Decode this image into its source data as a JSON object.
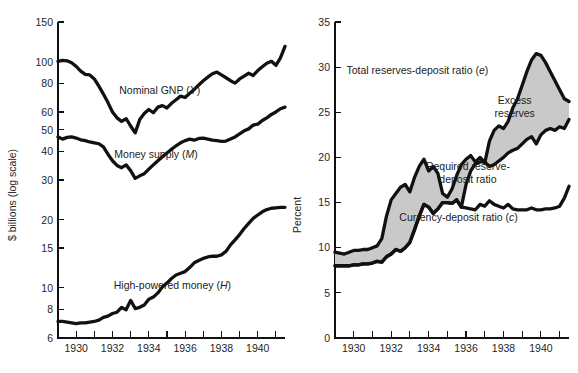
{
  "figure": {
    "background": "#ffffff",
    "line_color": "#111111",
    "band_color": "#c9c9c9",
    "axis_color": "#111111"
  },
  "chart_data": [
    {
      "id": "left",
      "type": "line",
      "title": "",
      "xlabel": "",
      "ylabel": "$ billions (log scale)",
      "yscale": "log",
      "ylim": [
        6,
        150
      ],
      "xlim": [
        1929.0,
        1941.5
      ],
      "grid": false,
      "legend": "inline-annotations",
      "yticks": [
        6,
        8,
        10,
        15,
        20,
        30,
        40,
        50,
        60,
        80,
        100,
        150
      ],
      "ytick_labels": [
        "6",
        "8",
        "10",
        "15",
        "20",
        "30",
        "40",
        "50",
        "60",
        "80",
        "100",
        "150"
      ],
      "xticks": [
        1929,
        1930,
        1931,
        1932,
        1933,
        1934,
        1935,
        1936,
        1937,
        1938,
        1939,
        1940,
        1941
      ],
      "xtick_labels": [
        "",
        "1930",
        "",
        "1932",
        "",
        "1934",
        "",
        "1936",
        "",
        "1938",
        "",
        "1940",
        ""
      ],
      "annotations": [
        {
          "text": "Nominal GNP (Y)",
          "italic_tail": "Y",
          "x": 1934.6,
          "y": 72
        },
        {
          "text": "Money supply (M)",
          "italic_tail": "M",
          "x": 1934.4,
          "y": 37.5
        },
        {
          "text": "High-powered money (H)",
          "italic_tail": "H",
          "x": 1935.3,
          "y": 9.9
        }
      ],
      "series": [
        {
          "name": "Nominal GNP (Y)",
          "symbol": "Y",
          "x": [
            1929.0,
            1929.25,
            1929.5,
            1929.75,
            1930.0,
            1930.25,
            1930.5,
            1930.75,
            1931.0,
            1931.25,
            1931.5,
            1931.75,
            1932.0,
            1932.25,
            1932.5,
            1932.75,
            1933.0,
            1933.25,
            1933.5,
            1933.75,
            1934.0,
            1934.25,
            1934.5,
            1934.75,
            1935.0,
            1935.25,
            1935.5,
            1935.75,
            1936.0,
            1936.25,
            1936.5,
            1936.75,
            1937.0,
            1937.25,
            1937.5,
            1937.75,
            1938.0,
            1938.25,
            1938.5,
            1938.75,
            1939.0,
            1939.25,
            1939.5,
            1939.75,
            1940.0,
            1940.25,
            1940.5,
            1940.75,
            1941.0,
            1941.25,
            1941.5
          ],
          "y": [
            100.5,
            101.5,
            101.0,
            99.0,
            95.5,
            91.0,
            88.0,
            87.5,
            84.0,
            78.0,
            72.0,
            66.0,
            60.0,
            56.5,
            54.5,
            56.0,
            52.0,
            48.5,
            55.5,
            59.0,
            61.5,
            59.5,
            63.0,
            64.0,
            62.5,
            65.5,
            68.0,
            70.5,
            69.5,
            72.5,
            75.5,
            79.0,
            82.5,
            85.5,
            88.5,
            90.0,
            87.5,
            85.0,
            82.5,
            80.5,
            84.0,
            86.5,
            89.0,
            87.0,
            91.5,
            95.0,
            98.5,
            100.5,
            96.5,
            104.0,
            117.0
          ]
        },
        {
          "name": "Money supply (M)",
          "symbol": "M",
          "x": [
            1929.0,
            1929.25,
            1929.5,
            1929.75,
            1930.0,
            1930.25,
            1930.5,
            1930.75,
            1931.0,
            1931.25,
            1931.5,
            1931.75,
            1932.0,
            1932.25,
            1932.5,
            1932.75,
            1933.0,
            1933.25,
            1933.5,
            1933.75,
            1934.0,
            1934.25,
            1934.5,
            1934.75,
            1935.0,
            1935.25,
            1935.5,
            1935.75,
            1936.0,
            1936.25,
            1936.5,
            1936.75,
            1937.0,
            1937.25,
            1937.5,
            1937.75,
            1938.0,
            1938.25,
            1938.5,
            1938.75,
            1939.0,
            1939.25,
            1939.5,
            1939.75,
            1940.0,
            1940.25,
            1940.5,
            1940.75,
            1941.0,
            1941.25,
            1941.5
          ],
          "y": [
            46.5,
            45.5,
            46.3,
            46.5,
            46.0,
            45.2,
            44.8,
            44.2,
            43.8,
            43.4,
            42.0,
            39.0,
            36.5,
            34.8,
            34.0,
            35.0,
            33.0,
            30.5,
            31.3,
            32.0,
            33.5,
            35.0,
            36.5,
            38.0,
            39.5,
            41.0,
            42.5,
            43.8,
            44.8,
            45.5,
            45.0,
            45.8,
            46.0,
            45.5,
            45.0,
            44.8,
            44.5,
            44.6,
            45.5,
            46.5,
            48.0,
            49.5,
            50.5,
            52.5,
            53.0,
            55.0,
            56.5,
            58.5,
            60.0,
            62.0,
            63.0
          ]
        },
        {
          "name": "High-powered money (H)",
          "symbol": "H",
          "x": [
            1929.0,
            1929.25,
            1929.5,
            1929.75,
            1930.0,
            1930.25,
            1930.5,
            1930.75,
            1931.0,
            1931.25,
            1931.5,
            1931.75,
            1932.0,
            1932.25,
            1932.5,
            1932.75,
            1933.0,
            1933.25,
            1933.5,
            1933.75,
            1934.0,
            1934.25,
            1934.5,
            1934.75,
            1935.0,
            1935.25,
            1935.5,
            1935.75,
            1936.0,
            1936.25,
            1936.5,
            1936.75,
            1937.0,
            1937.25,
            1937.5,
            1937.75,
            1938.0,
            1938.25,
            1938.5,
            1938.75,
            1939.0,
            1939.25,
            1939.5,
            1939.75,
            1940.0,
            1940.25,
            1940.5,
            1940.75,
            1941.0,
            1941.25,
            1941.5
          ],
          "y": [
            7.1,
            7.1,
            7.05,
            7.0,
            6.95,
            7.0,
            7.0,
            7.05,
            7.1,
            7.2,
            7.4,
            7.5,
            7.7,
            7.8,
            8.2,
            8.0,
            8.8,
            8.1,
            8.2,
            8.4,
            8.9,
            9.1,
            9.5,
            10.1,
            10.5,
            11.0,
            11.4,
            11.6,
            11.8,
            12.3,
            12.9,
            13.2,
            13.5,
            13.7,
            13.8,
            13.8,
            14.0,
            14.5,
            15.5,
            16.3,
            17.2,
            18.3,
            19.3,
            20.3,
            21.0,
            21.7,
            22.2,
            22.5,
            22.6,
            22.7,
            22.7
          ]
        }
      ]
    },
    {
      "id": "right",
      "type": "line",
      "title": "",
      "xlabel": "",
      "ylabel": "Percent",
      "yscale": "linear",
      "ylim": [
        0,
        35
      ],
      "xlim": [
        1929.0,
        1941.5
      ],
      "grid": false,
      "legend": "inline-annotations",
      "yticks": [
        0,
        5,
        10,
        15,
        20,
        25,
        30,
        35
      ],
      "ytick_labels": [
        "0",
        "5",
        "10",
        "15",
        "20",
        "25",
        "30",
        "35"
      ],
      "xticks": [
        1929,
        1930,
        1931,
        1932,
        1933,
        1934,
        1935,
        1936,
        1937,
        1938,
        1939,
        1940,
        1941
      ],
      "xtick_labels": [
        "",
        "1930",
        "",
        "1932",
        "",
        "1934",
        "",
        "1936",
        "",
        "1938",
        "",
        "1940",
        ""
      ],
      "shaded_band": {
        "label": "Excess reserves",
        "between": [
          "Total reserves-deposit ratio (e)",
          "Required reserve-deposit ratio"
        ],
        "color": "#c9c9c9"
      },
      "annotations": [
        {
          "text": "Total reserves-deposit ratio (e)",
          "italic_tail": "e",
          "x": 1933.4,
          "y": 29.2
        },
        {
          "text": "Excess reserves",
          "x": 1938.6,
          "y": 25.9
        },
        {
          "text": "Required reserve-deposit ratio",
          "x": 1936.1,
          "y": 18.6
        },
        {
          "text": "Currency-deposit ratio (c)",
          "italic_tail": "c",
          "x": 1935.6,
          "y": 13.0
        }
      ],
      "series": [
        {
          "name": "Total reserves-deposit ratio (e)",
          "symbol": "e",
          "x": [
            1929.0,
            1929.25,
            1929.5,
            1929.75,
            1930.0,
            1930.25,
            1930.5,
            1930.75,
            1931.0,
            1931.25,
            1931.5,
            1931.75,
            1932.0,
            1932.25,
            1932.5,
            1932.75,
            1933.0,
            1933.25,
            1933.5,
            1933.75,
            1934.0,
            1934.25,
            1934.5,
            1934.75,
            1935.0,
            1935.25,
            1935.5,
            1935.75,
            1936.0,
            1936.25,
            1936.5,
            1936.75,
            1937.0,
            1937.25,
            1937.5,
            1937.75,
            1938.0,
            1938.25,
            1938.5,
            1938.75,
            1939.0,
            1939.25,
            1939.5,
            1939.75,
            1940.0,
            1940.25,
            1940.5,
            1940.75,
            1941.0,
            1941.25,
            1941.5
          ],
          "y": [
            9.5,
            9.4,
            9.3,
            9.5,
            9.7,
            9.7,
            9.8,
            9.8,
            10.0,
            10.2,
            11.0,
            13.5,
            15.3,
            16.0,
            16.7,
            17.0,
            16.2,
            17.8,
            19.0,
            19.8,
            18.5,
            19.0,
            18.2,
            16.0,
            15.6,
            16.5,
            18.0,
            19.2,
            19.8,
            20.2,
            19.5,
            20.0,
            19.4,
            21.8,
            23.0,
            23.5,
            23.2,
            24.0,
            25.5,
            26.5,
            28.0,
            29.5,
            30.8,
            31.5,
            31.3,
            30.5,
            29.5,
            28.5,
            27.5,
            26.5,
            26.2
          ]
        },
        {
          "name": "Required reserve-deposit ratio",
          "x": [
            1929.0,
            1929.25,
            1929.5,
            1929.75,
            1930.0,
            1930.25,
            1930.5,
            1930.75,
            1931.0,
            1931.25,
            1931.5,
            1931.75,
            1932.0,
            1932.25,
            1932.5,
            1932.75,
            1933.0,
            1933.25,
            1933.5,
            1933.75,
            1934.0,
            1934.25,
            1934.5,
            1934.75,
            1935.0,
            1935.25,
            1935.5,
            1935.75,
            1936.0,
            1936.25,
            1936.5,
            1936.75,
            1937.0,
            1937.25,
            1937.5,
            1937.75,
            1938.0,
            1938.25,
            1938.5,
            1938.75,
            1939.0,
            1939.25,
            1939.5,
            1939.75,
            1940.0,
            1940.25,
            1940.5,
            1940.75,
            1941.0,
            1941.25,
            1941.5
          ],
          "y": [
            8.0,
            8.0,
            8.0,
            8.0,
            8.1,
            8.1,
            8.2,
            8.2,
            8.3,
            8.5,
            8.4,
            9.0,
            9.3,
            9.8,
            9.6,
            10.0,
            10.6,
            12.0,
            13.5,
            14.8,
            14.5,
            13.8,
            14.3,
            15.0,
            15.0,
            14.9,
            15.3,
            14.5,
            17.0,
            18.5,
            19.3,
            19.5,
            19.5,
            19.0,
            19.2,
            19.6,
            20.0,
            20.5,
            20.8,
            21.0,
            21.5,
            22.0,
            22.3,
            21.5,
            22.5,
            23.0,
            23.2,
            23.0,
            23.4,
            23.2,
            24.2
          ]
        },
        {
          "name": "Currency-deposit ratio (c)",
          "symbol": "c",
          "x": [
            1929.0,
            1929.25,
            1929.5,
            1929.75,
            1930.0,
            1930.25,
            1930.5,
            1930.75,
            1931.0,
            1931.25,
            1931.5,
            1931.75,
            1932.0,
            1932.25,
            1932.5,
            1932.75,
            1933.0,
            1933.25,
            1933.5,
            1933.75,
            1934.0,
            1934.25,
            1934.5,
            1934.75,
            1935.0,
            1935.25,
            1935.5,
            1935.75,
            1936.0,
            1936.25,
            1936.5,
            1936.75,
            1937.0,
            1937.25,
            1937.5,
            1937.75,
            1938.0,
            1938.25,
            1938.5,
            1938.75,
            1939.0,
            1939.25,
            1939.5,
            1939.75,
            1940.0,
            1940.25,
            1940.5,
            1940.75,
            1941.0,
            1941.25,
            1941.5
          ],
          "y": [
            8.0,
            8.0,
            8.0,
            8.0,
            8.1,
            8.1,
            8.2,
            8.2,
            8.3,
            8.5,
            8.4,
            9.0,
            9.3,
            9.8,
            9.6,
            10.0,
            10.6,
            12.0,
            13.5,
            14.8,
            14.5,
            13.8,
            14.3,
            15.0,
            15.0,
            14.9,
            15.3,
            14.5,
            14.4,
            14.3,
            14.2,
            14.8,
            14.6,
            15.2,
            14.8,
            14.6,
            14.4,
            14.8,
            14.3,
            14.2,
            14.2,
            14.2,
            14.4,
            14.2,
            14.2,
            14.3,
            14.3,
            14.4,
            14.6,
            15.5,
            16.8
          ]
        }
      ]
    }
  ]
}
